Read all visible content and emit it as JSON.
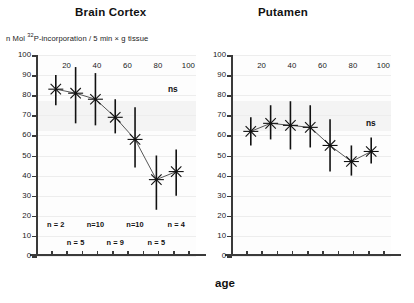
{
  "figure": {
    "ylabel_prefix": "n Mol ",
    "ylabel_superscript": "32",
    "ylabel_suffix": "P-incorporation / 5 min × g tissue",
    "xlabel": "age"
  },
  "panels": [
    {
      "key": "brain_cortex",
      "title": "Brain Cortex",
      "ns_label": "ns"
    },
    {
      "key": "putamen",
      "title": "Putamen",
      "ns_label": "ns"
    }
  ],
  "n_labels_row_top": [
    {
      "text": "n = 2",
      "age": 13
    },
    {
      "text": "n=10",
      "age": 39
    },
    {
      "text": "n=10",
      "age": 65
    },
    {
      "text": "n = 4",
      "age": 92
    }
  ],
  "n_labels_row_bottom": [
    {
      "text": "n = 5",
      "age": 26
    },
    {
      "text": "n = 9",
      "age": 52
    },
    {
      "text": "n = 5",
      "age": 79
    }
  ],
  "chart_data": [
    {
      "type": "scatter",
      "title": "Brain Cortex",
      "xlabel": "age",
      "ylabel": "n Mol 32P-incorporation / 5 min × g tissue",
      "xlim": [
        0,
        105
      ],
      "ylim": [
        0,
        100
      ],
      "xticks": [
        0,
        10,
        20,
        30,
        40,
        50,
        60,
        70,
        80,
        90,
        100
      ],
      "xticklabels": [
        "",
        "",
        "20",
        "",
        "40",
        "",
        "60",
        "",
        "80",
        "",
        "100"
      ],
      "yticks": [
        0,
        10,
        20,
        30,
        40,
        50,
        60,
        70,
        80,
        90,
        100
      ],
      "yticklabels": [
        "0",
        "10",
        "20",
        "30",
        "40",
        "50",
        "60",
        "70",
        "80",
        "90",
        "100"
      ],
      "grid": true,
      "legend": "none",
      "marker": "asterisk-with-cap",
      "errorbar": "vertical-range",
      "annotations": [
        {
          "text": "ns",
          "x": 96,
          "y": 80
        }
      ],
      "points": [
        {
          "x": 13,
          "y": 83,
          "err_low": 75,
          "err_high": 90,
          "n": 2
        },
        {
          "x": 26,
          "y": 81,
          "err_low": 66,
          "err_high": 94,
          "n": 5
        },
        {
          "x": 39,
          "y": 78,
          "err_low": 65,
          "err_high": 91,
          "n": 10
        },
        {
          "x": 52,
          "y": 69,
          "err_low": 61,
          "err_high": 78,
          "n": 9
        },
        {
          "x": 65,
          "y": 58,
          "err_low": 44,
          "err_high": 74,
          "n": 10
        },
        {
          "x": 79,
          "y": 38,
          "err_low": 23,
          "err_high": 50,
          "n": 5
        },
        {
          "x": 92,
          "y": 42,
          "err_low": 30,
          "err_high": 53,
          "n": 4
        }
      ]
    },
    {
      "type": "scatter",
      "title": "Putamen",
      "xlabel": "age",
      "ylabel": "n Mol 32P-incorporation / 5 min × g tissue",
      "xlim": [
        0,
        105
      ],
      "ylim": [
        0,
        100
      ],
      "xticks": [
        0,
        10,
        20,
        30,
        40,
        50,
        60,
        70,
        80,
        90,
        100
      ],
      "xticklabels": [
        "",
        "",
        "20",
        "",
        "40",
        "",
        "60",
        "",
        "80",
        "",
        "100"
      ],
      "yticks": [
        0,
        10,
        20,
        30,
        40,
        50,
        60,
        70,
        80,
        90,
        100
      ],
      "yticklabels": [
        "0",
        "10",
        "20",
        "30",
        "40",
        "50",
        "60",
        "70",
        "80",
        "90",
        "100"
      ],
      "grid": true,
      "legend": "none",
      "marker": "asterisk-with-cap",
      "errorbar": "vertical-range",
      "annotations": [
        {
          "text": "ns",
          "x": 96,
          "y": 65
        }
      ],
      "points": [
        {
          "x": 13,
          "y": 62,
          "err_low": 55,
          "err_high": 69
        },
        {
          "x": 26,
          "y": 66,
          "err_low": 58,
          "err_high": 75
        },
        {
          "x": 39,
          "y": 65,
          "err_low": 53,
          "err_high": 77
        },
        {
          "x": 52,
          "y": 64,
          "err_low": 54,
          "err_high": 75
        },
        {
          "x": 65,
          "y": 55,
          "err_low": 42,
          "err_high": 68
        },
        {
          "x": 79,
          "y": 47,
          "err_low": 40,
          "err_high": 55
        },
        {
          "x": 92,
          "y": 52,
          "err_low": 46,
          "err_high": 59
        }
      ]
    }
  ]
}
